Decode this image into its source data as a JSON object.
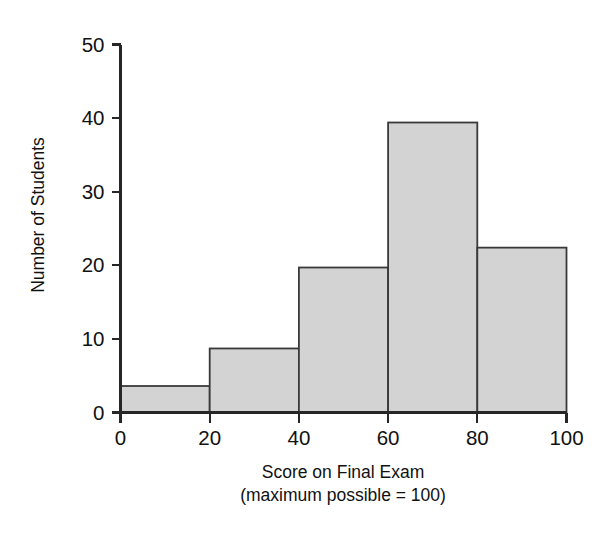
{
  "chart_data": {
    "type": "bar",
    "subtype": "histogram",
    "title": "",
    "xlabel": "Score on Final Exam",
    "xlabel_sub": "(maximum possible = 100)",
    "ylabel": "Number of Students",
    "categories": [
      "0-20",
      "20-40",
      "40-60",
      "60-80",
      "80-100"
    ],
    "bin_edges": [
      0,
      20,
      40,
      60,
      80,
      100
    ],
    "values": [
      3.6,
      8.7,
      19.7,
      39.4,
      22.4
    ],
    "xlim": [
      0,
      100
    ],
    "ylim": [
      0,
      50
    ],
    "xticks": [
      0,
      20,
      40,
      60,
      80,
      100
    ],
    "xtick_labels": [
      "0",
      "20",
      "40",
      "60",
      "80",
      "100"
    ],
    "yticks": [
      0,
      10,
      20,
      30,
      40,
      50
    ],
    "ytick_labels": [
      "0",
      "10",
      "20",
      "30",
      "40",
      "50"
    ],
    "grid": false,
    "legend": null,
    "bar_fill_color": "#d3d3d3",
    "bar_edge_color": "#3a3a3a",
    "axis_color": "#262626",
    "background_color": "#ffffff"
  },
  "figure": {
    "ylabel_text": "Number of Students",
    "xlabel_line1": "Score on Final Exam",
    "xlabel_line2": "(maximum possible = 100)"
  }
}
